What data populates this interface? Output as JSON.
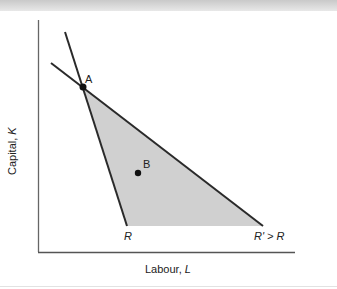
{
  "diagram": {
    "title": "",
    "y_axis": {
      "label_prefix": "Capital, ",
      "label_var": "K"
    },
    "x_axis": {
      "label_prefix": "Labour, ",
      "label_var": "L"
    },
    "points": [
      {
        "id": "A",
        "label": "A"
      },
      {
        "id": "B",
        "label": "B"
      }
    ],
    "budget_lines": [
      {
        "id": "R",
        "label": "R"
      },
      {
        "id": "R_prime",
        "label": "R' > R"
      }
    ],
    "colors": {
      "shaded_region": "#cfcfcf",
      "lines": "#2a2a2a",
      "axes": "#555555"
    }
  }
}
